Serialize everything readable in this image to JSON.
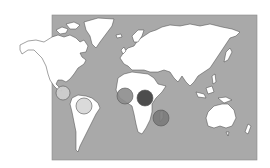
{
  "map": {
    "type": "world-map",
    "ocean_color": "#a9a9a9",
    "land_color": "#ffffff",
    "outline_color": "#444444",
    "frame": {
      "x": 52,
      "y": 15,
      "width": 205,
      "height": 145
    },
    "markers": [
      {
        "name": "central-america-marker",
        "region": "Central America",
        "cx": 63,
        "cy": 93,
        "r": 7,
        "fill": "#cfcfcf"
      },
      {
        "name": "south-america-marker",
        "region": "Northern South America",
        "cx": 84,
        "cy": 106,
        "r": 8,
        "fill": "#d6d6d6"
      },
      {
        "name": "west-africa-marker",
        "region": "West Africa",
        "cx": 125,
        "cy": 96,
        "r": 8,
        "fill": "#8c8c8c"
      },
      {
        "name": "central-africa-marker",
        "region": "Central / East Africa",
        "cx": 145,
        "cy": 98,
        "r": 8,
        "fill": "#3a3a3a"
      },
      {
        "name": "madagascar-marker",
        "region": "Madagascar",
        "cx": 161,
        "cy": 118,
        "r": 8,
        "fill": "#7a7a7a"
      }
    ]
  }
}
